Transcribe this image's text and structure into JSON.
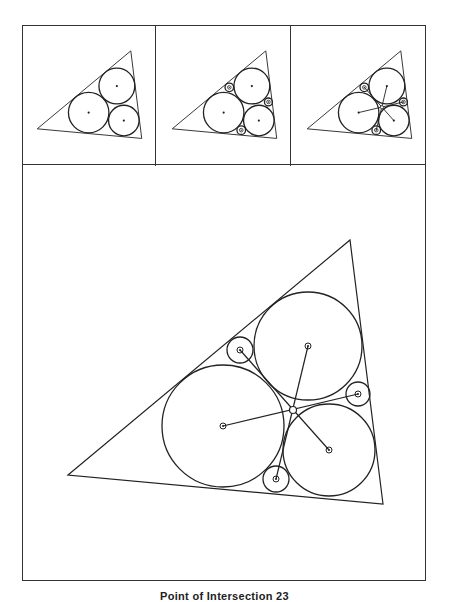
{
  "figure": {
    "caption": "Point of Intersection 23",
    "line_color": "#222222",
    "panels": [
      {
        "id": "panel-1",
        "show_small_circles": false,
        "show_lines": false
      },
      {
        "id": "panel-2",
        "show_small_circles": true,
        "show_lines": false
      },
      {
        "id": "panel-3",
        "show_small_circles": true,
        "show_lines": true
      },
      {
        "id": "panel-main",
        "show_small_circles": true,
        "show_lines": true
      }
    ],
    "geometry": {
      "triangle": [
        [
          46,
          310
        ],
        [
          328,
          75
        ],
        [
          361,
          339
        ]
      ],
      "large_circles": [
        {
          "name": "left",
          "cx": 201,
          "cy": 261,
          "r": 61
        },
        {
          "name": "upper",
          "cx": 286,
          "cy": 181,
          "r": 54
        },
        {
          "name": "lower-right",
          "cx": 307,
          "cy": 285,
          "r": 46
        }
      ],
      "small_circles": [
        {
          "name": "top",
          "cx": 218,
          "cy": 185,
          "r": 13
        },
        {
          "name": "right",
          "cx": 336,
          "cy": 229,
          "r": 12
        },
        {
          "name": "bottom",
          "cx": 254,
          "cy": 314,
          "r": 13
        }
      ],
      "connecting_lines": [
        {
          "from": "upper",
          "to": "bottom"
        },
        {
          "from": "left",
          "to": "right"
        },
        {
          "from": "lower-right",
          "to": "top"
        }
      ],
      "intersection_point": {
        "cx": 271,
        "cy": 245
      }
    }
  }
}
